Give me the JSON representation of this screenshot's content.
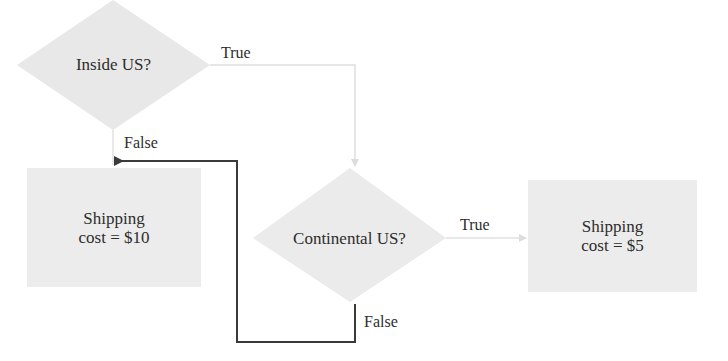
{
  "diagram": {
    "type": "flowchart",
    "colors": {
      "shape_fill": "#e8e8e8",
      "box_fill": "#ececec",
      "true_edge": "#dcdcdc",
      "false_edge": "#3a3a3a",
      "text": "#2d2d2d"
    },
    "nodes": [
      {
        "id": "inside_us",
        "shape": "diamond",
        "label": "Inside US?"
      },
      {
        "id": "continental_us",
        "shape": "diamond",
        "label": "Continental US?"
      },
      {
        "id": "cost_10",
        "shape": "rect",
        "line1": "Shipping",
        "line2": "cost = $10"
      },
      {
        "id": "cost_5",
        "shape": "rect",
        "line1": "Shipping",
        "line2": "cost = $5"
      }
    ],
    "edges": [
      {
        "from": "inside_us",
        "to": "continental_us",
        "label": "True"
      },
      {
        "from": "inside_us",
        "to": "cost_10",
        "label": "False"
      },
      {
        "from": "continental_us",
        "to": "cost_5",
        "label": "True"
      },
      {
        "from": "continental_us",
        "to": "cost_10",
        "label": "False"
      }
    ]
  }
}
